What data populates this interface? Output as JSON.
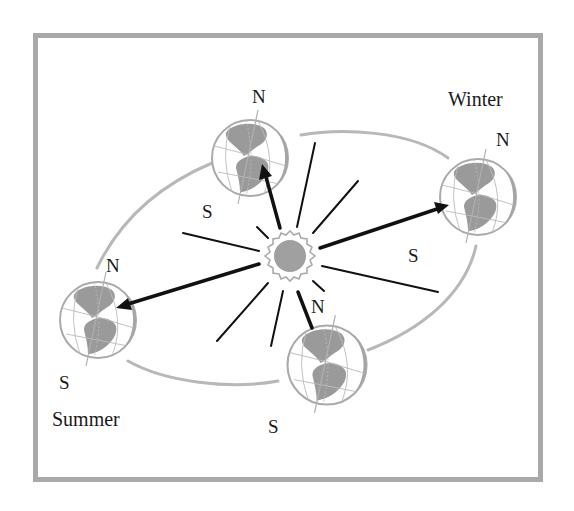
{
  "diagram": {
    "colors": {
      "frame": "#a9a9a9",
      "orbit": "#b5b5b5",
      "land": "#9a9a9a",
      "globe_outline": "#a8a8a8",
      "sun_disc": "#a0a0a0",
      "ray": "#111111",
      "text": "#1a1a1a"
    },
    "season_labels": {
      "winter": "Winter",
      "summer": "Summer"
    },
    "globes": [
      {
        "id": "top",
        "north_label": "N",
        "south_label": "S"
      },
      {
        "id": "right",
        "north_label": "N",
        "south_label": "S"
      },
      {
        "id": "left",
        "north_label": "N",
        "south_label": "S"
      },
      {
        "id": "bottom",
        "north_label": "N",
        "south_label": "S"
      }
    ]
  }
}
